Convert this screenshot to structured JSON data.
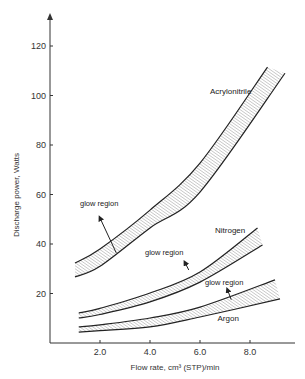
{
  "chart_data": {
    "type": "area",
    "title": "",
    "xlabel": "Flow rate, cm³ (STP)/min",
    "ylabel": "Discharge power, Watts",
    "xlim": [
      0,
      10
    ],
    "ylim": [
      0,
      130
    ],
    "x_ticks": [
      2.0,
      4.0,
      6.0,
      8.0
    ],
    "x_tick_labels": [
      "2.0",
      "4.0",
      "6.0",
      "8.0"
    ],
    "y_ticks": [
      20,
      40,
      60,
      80,
      100,
      120
    ],
    "y_tick_labels": [
      "20",
      "40",
      "60",
      "80",
      "100",
      "120"
    ],
    "grid": false,
    "legend": "none",
    "series": [
      {
        "name": "Acrylonitrile",
        "upper": {
          "x": [
            1.0,
            2.0,
            4.0,
            6.0,
            8.7
          ],
          "y": [
            32.3,
            38,
            53.7,
            72.7,
            111.5
          ]
        },
        "lower": {
          "x": [
            1.0,
            2.0,
            4.0,
            6.0,
            9.4
          ],
          "y": [
            26.7,
            31,
            46.5,
            61,
            109
          ]
        }
      },
      {
        "name": "Nitrogen",
        "upper": {
          "x": [
            1.15,
            2.0,
            4.0,
            6.0,
            8.3
          ],
          "y": [
            12.1,
            14,
            20.2,
            28.7,
            46.5
          ]
        },
        "lower": {
          "x": [
            1.15,
            2.0,
            4.0,
            6.0,
            8.5
          ],
          "y": [
            10.1,
            11.5,
            16.6,
            24.6,
            39.6
          ]
        }
      },
      {
        "name": "Argon",
        "upper": {
          "x": [
            1.15,
            2.0,
            4.0,
            6.0,
            9.0
          ],
          "y": [
            6.5,
            7.3,
            10.1,
            14.5,
            25.5
          ]
        },
        "lower": {
          "x": [
            1.15,
            2.0,
            4.0,
            6.0,
            9.2
          ],
          "y": [
            4.4,
            5,
            6.5,
            10.5,
            17.8
          ]
        }
      }
    ],
    "annotations": [
      {
        "text": "glow region",
        "series": "Acrylonitrile",
        "label_at": [
          1.2,
          55.5
        ],
        "arrow_from": [
          2.65,
          36.4
        ],
        "arrow_to": [
          2.0,
          50.5
        ]
      },
      {
        "text": "glow region",
        "series": "Nitrogen",
        "label_at": [
          3.8,
          35.5
        ],
        "arrow_from": [
          5.55,
          29.5
        ],
        "arrow_to": [
          5.4,
          32.5
        ]
      },
      {
        "text": "glow region",
        "series": "Argon",
        "label_at": [
          6.2,
          23.5
        ],
        "arrow_from": [
          7.25,
          17.5
        ],
        "arrow_to": [
          7.1,
          21.5
        ]
      }
    ],
    "series_labels": [
      {
        "text": "Acrylonitrile",
        "at": [
          6.4,
          100.5
        ]
      },
      {
        "text": "Nitrogen",
        "at": [
          6.6,
          44.5
        ]
      },
      {
        "text": "Argon",
        "at": [
          6.7,
          8.8
        ]
      }
    ]
  }
}
